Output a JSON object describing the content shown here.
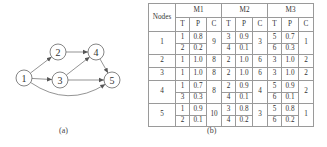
{
  "figure_a": {
    "caption": "(a)",
    "nodes": [
      {
        "id": "1",
        "label": "1",
        "x": 24,
        "y": 78
      },
      {
        "id": "2",
        "label": "2",
        "x": 58,
        "y": 52
      },
      {
        "id": "3",
        "label": "3",
        "x": 60,
        "y": 80
      },
      {
        "id": "4",
        "label": "4",
        "x": 96,
        "y": 52
      },
      {
        "id": "5",
        "label": "5",
        "x": 112,
        "y": 80
      }
    ],
    "edges": [
      {
        "from": "1",
        "to": "2"
      },
      {
        "from": "1",
        "to": "3"
      },
      {
        "from": "1",
        "to": "5",
        "curved": true
      },
      {
        "from": "2",
        "to": "4"
      },
      {
        "from": "3",
        "to": "4"
      },
      {
        "from": "3",
        "to": "5"
      },
      {
        "from": "4",
        "to": "5"
      }
    ]
  },
  "figure_b": {
    "caption": "(b)",
    "header": {
      "nodes": "Nodes",
      "groups": [
        "M1",
        "M2",
        "M3"
      ],
      "sub": [
        "T",
        "P",
        "C"
      ]
    },
    "rows": [
      {
        "node": "1",
        "M1": {
          "T": [
            "1",
            "2"
          ],
          "P": [
            "0.8",
            "0.2"
          ],
          "C": "9"
        },
        "M2": {
          "T": [
            "3",
            "4"
          ],
          "P": [
            "0.9",
            "0.1"
          ],
          "C": "3"
        },
        "M3": {
          "T": [
            "5",
            "6"
          ],
          "P": [
            "0.7",
            "0.3"
          ],
          "C": "1"
        }
      },
      {
        "node": "2",
        "M1": {
          "T": [
            "1"
          ],
          "P": [
            "1.0"
          ],
          "C": "8"
        },
        "M2": {
          "T": [
            "2"
          ],
          "P": [
            "1.0"
          ],
          "C": "6"
        },
        "M3": {
          "T": [
            "3"
          ],
          "P": [
            "1.0"
          ],
          "C": "2"
        }
      },
      {
        "node": "3",
        "M1": {
          "T": [
            "1"
          ],
          "P": [
            "1.0"
          ],
          "C": "8"
        },
        "M2": {
          "T": [
            "2"
          ],
          "P": [
            "1.0"
          ],
          "C": "6"
        },
        "M3": {
          "T": [
            "3"
          ],
          "P": [
            "1.0"
          ],
          "C": "2"
        }
      },
      {
        "node": "4",
        "M1": {
          "T": [
            "1",
            "3"
          ],
          "P": [
            "0.7",
            "0.3"
          ],
          "C": "8"
        },
        "M2": {
          "T": [
            "2",
            "4"
          ],
          "P": [
            "0.9",
            "0.1"
          ],
          "C": "4"
        },
        "M3": {
          "T": [
            "5",
            "6"
          ],
          "P": [
            "0.9",
            "0.1"
          ],
          "C": "2"
        }
      },
      {
        "node": "5",
        "M1": {
          "T": [
            "1",
            "2"
          ],
          "P": [
            "0.9",
            "0.1"
          ],
          "C": "10"
        },
        "M2": {
          "T": [
            "3",
            "4"
          ],
          "P": [
            "0.8",
            "0.2"
          ],
          "C": "3"
        },
        "M3": {
          "T": [
            "5",
            "6"
          ],
          "P": [
            "0.8",
            "0.2"
          ],
          "C": "1"
        }
      }
    ]
  }
}
